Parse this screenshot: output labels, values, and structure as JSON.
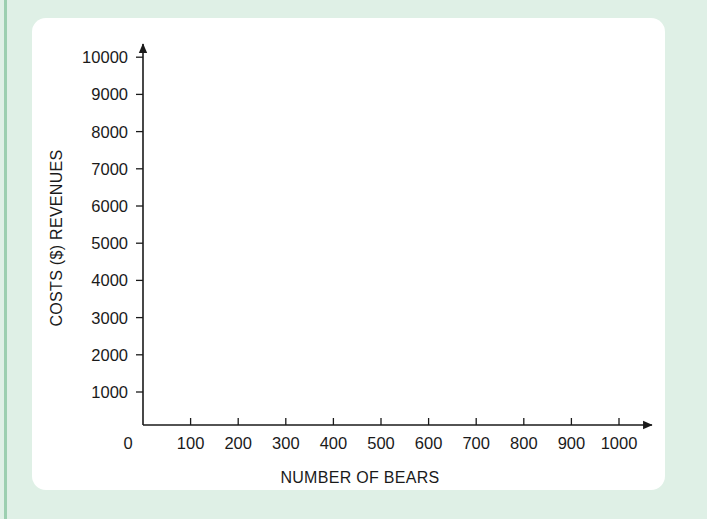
{
  "page": {
    "background_color": "#dff0e6",
    "stripe_color": "#9ccfb0",
    "card_color": "#ffffff"
  },
  "chart_data": {
    "type": "scatter",
    "title": "",
    "subtitle": "",
    "xlabel": "NUMBER OF BEARS",
    "ylabel": "COSTS ($) REVENUES",
    "x": [],
    "values": [],
    "series": [],
    "xlim": [
      0,
      1000
    ],
    "ylim": [
      0,
      10000
    ],
    "x_ticks": [
      100,
      200,
      300,
      400,
      500,
      600,
      700,
      800,
      900,
      1000
    ],
    "x_tick_labels": [
      "100",
      "200",
      "300",
      "400",
      "500",
      "600",
      "700",
      "800",
      "900",
      "1000"
    ],
    "y_ticks": [
      1000,
      2000,
      3000,
      4000,
      5000,
      6000,
      7000,
      8000,
      9000,
      10000
    ],
    "y_tick_labels": [
      "1000",
      "2000",
      "3000",
      "4000",
      "5000",
      "6000",
      "7000",
      "8000",
      "9000",
      "10000"
    ],
    "origin_label": "0",
    "grid": false,
    "legend": null,
    "annotations": [],
    "axis_color": "#1a1a1a",
    "note": "Empty coordinate axes with no plotted data points"
  }
}
